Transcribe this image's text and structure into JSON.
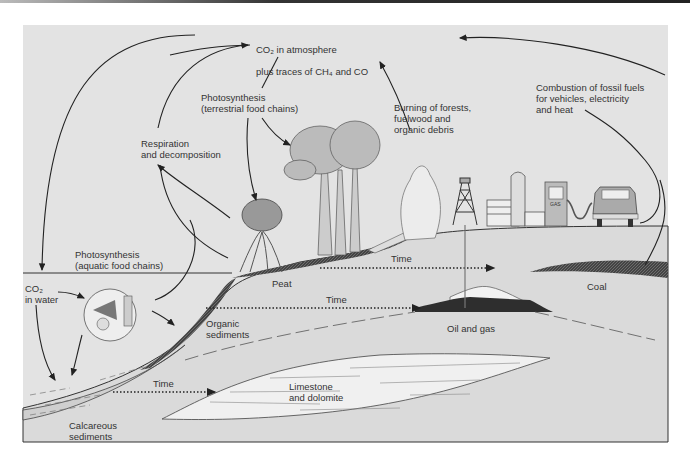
{
  "diagram": {
    "labels": {
      "atmosphere_line1": "CO₂ in atmosphere",
      "atmosphere_line2": "plus traces of CH₄ and CO",
      "terrestrial_photosynthesis": "Photosynthesis\n(terrestrial food chains)",
      "respiration": "Respiration\nand decomposition",
      "burning": "Burning of forests,\nfuelwood and\norganic debris",
      "combustion": "Combustion of fossil fuels\nfor vehicles, electricity\nand heat",
      "aquatic_photosynthesis": "Photosynthesis\n(aquatic food chains)",
      "co2_water": "CO₂\nin water",
      "peat": "Peat",
      "time_1": "Time",
      "time_2": "Time",
      "time_3": "Time",
      "coal": "Coal",
      "organic_sediments": "Organic\nsediments",
      "oil_gas": "Oil and gas",
      "limestone": "Limestone\nand dolomite",
      "calcareous": "Calcareous\nsediments",
      "pump_sign": "GAS"
    },
    "colors": {
      "background": "#e3e3e3",
      "ground": "#d8d8d8",
      "dark_deposit": "#3a3a3a",
      "line": "#222222",
      "text": "#333333"
    }
  }
}
